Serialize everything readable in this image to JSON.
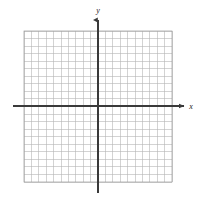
{
  "figure": {
    "type": "coordinate-grid",
    "title": "",
    "background_color": "#ffffff",
    "width": 200,
    "height": 205
  },
  "grid": {
    "columns": 20,
    "rows": 20,
    "cell_size_px": 7.4,
    "left_px": 24,
    "top_px": 31,
    "right_px": 172,
    "bottom_px": 182,
    "minor_color": "#b5b5b5",
    "minor_width_px": 0.6,
    "border_color": "#9a9a9a"
  },
  "axes": {
    "x_axis": {
      "label": "x",
      "color": "#3a3a3a",
      "width_px": 1.6,
      "y_px": 106,
      "start_px": 13,
      "end_px": 186,
      "arrow": "right"
    },
    "y_axis": {
      "label": "y",
      "color": "#3a3a3a",
      "width_px": 1.6,
      "x_px": 98,
      "start_px": 193,
      "end_px": 18,
      "arrow": "up"
    },
    "origin": {
      "x_px": 98,
      "y_px": 106
    }
  },
  "chart_data": {
    "type": "scatter",
    "title": "",
    "xlabel": "x",
    "ylabel": "y",
    "xlim": [
      -10,
      10
    ],
    "ylim": [
      -10,
      10
    ],
    "xticks": [
      -10,
      -9,
      -8,
      -7,
      -6,
      -5,
      -4,
      -3,
      -2,
      -1,
      0,
      1,
      2,
      3,
      4,
      5,
      6,
      7,
      8,
      9,
      10
    ],
    "yticks": [
      -10,
      -9,
      -8,
      -7,
      -6,
      -5,
      -4,
      -3,
      -2,
      -1,
      0,
      1,
      2,
      3,
      4,
      5,
      6,
      7,
      8,
      9,
      10
    ],
    "xtick_labels": [],
    "ytick_labels": [],
    "grid": true,
    "legend": null,
    "series": [],
    "annotations": []
  }
}
